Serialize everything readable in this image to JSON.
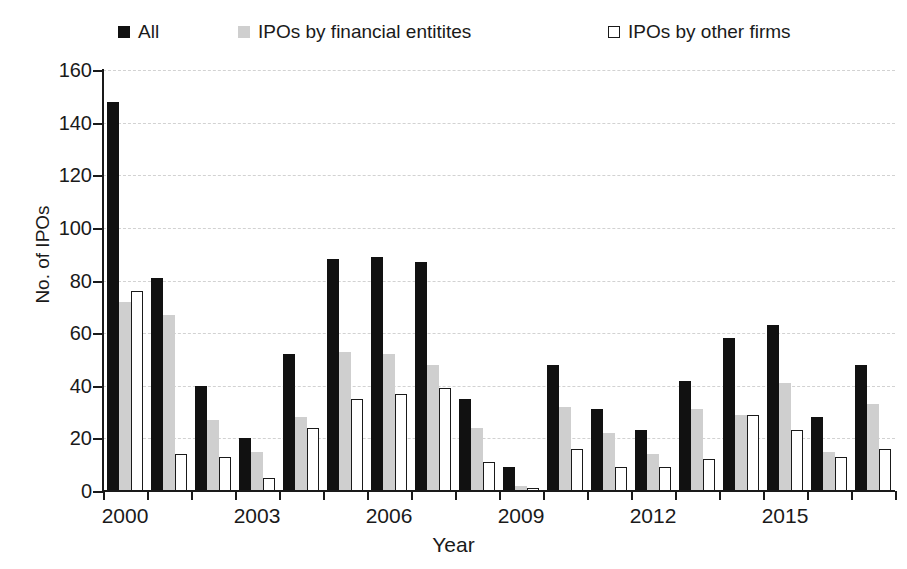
{
  "chart_data": {
    "type": "bar",
    "title": "",
    "xlabel": "Year",
    "ylabel": "No. of IPOs",
    "ylim": [
      0,
      160
    ],
    "ytick_step": 20,
    "yticks": [
      0,
      20,
      40,
      60,
      80,
      100,
      120,
      140,
      160
    ],
    "grid": true,
    "grid_axis": "y",
    "legend_position": "top",
    "categories": [
      "2000",
      "2001",
      "2002",
      "2003",
      "2004",
      "2005",
      "2006",
      "2007",
      "2008",
      "2009",
      "2010",
      "2011",
      "2012",
      "2013",
      "2014",
      "2015",
      "2016",
      "2017"
    ],
    "xtick_labels_shown": [
      "2000",
      "2003",
      "2006",
      "2009",
      "2012",
      "2015"
    ],
    "series": [
      {
        "name": "All",
        "color": "#111111",
        "values": [
          148,
          81,
          40,
          20,
          52,
          88,
          89,
          87,
          35,
          9,
          48,
          31,
          23,
          42,
          58,
          63,
          28,
          48
        ]
      },
      {
        "name": "IPOs by financial entitites",
        "color": "#cfcfcf",
        "values": [
          72,
          67,
          27,
          15,
          28,
          53,
          52,
          48,
          24,
          2,
          32,
          22,
          14,
          31,
          29,
          41,
          15,
          33
        ]
      },
      {
        "name": "IPOs by other firms",
        "color": "#ffffff",
        "values": [
          76,
          14,
          13,
          5,
          24,
          35,
          37,
          39,
          11,
          1,
          16,
          9,
          9,
          12,
          29,
          23,
          13,
          16
        ]
      }
    ]
  },
  "legend": {
    "items": [
      {
        "label": "All",
        "swatch": "filled-black-square-icon"
      },
      {
        "label": "IPOs by financial entitites",
        "swatch": "filled-gray-square-icon"
      },
      {
        "label": "IPOs by other firms",
        "swatch": "outlined-white-square-icon"
      }
    ]
  },
  "axes": {
    "y_title": "No. of IPOs",
    "x_title": "Year"
  }
}
